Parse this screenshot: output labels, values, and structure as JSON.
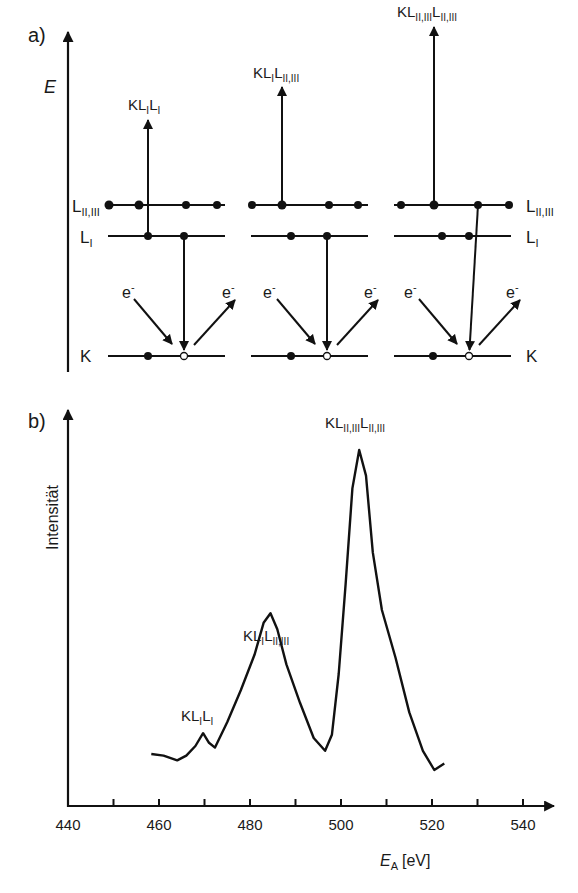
{
  "panel_a": {
    "label": "a)",
    "axis_label": "E",
    "levels": {
      "L23": {
        "main": "L",
        "sub": "II,III"
      },
      "L1": {
        "main": "L",
        "sub": "I"
      },
      "K": {
        "main": "K",
        "sub": ""
      }
    },
    "electron_label": "e",
    "electron_sup": "-",
    "transitions": [
      {
        "name": "KL1L1",
        "parts": [
          [
            "K",
            ""
          ],
          [
            "L",
            "I"
          ],
          [
            "L",
            "I"
          ]
        ]
      },
      {
        "name": "KL1L23",
        "parts": [
          [
            "K",
            ""
          ],
          [
            "L",
            "I"
          ],
          [
            "L",
            "II,III"
          ]
        ]
      },
      {
        "name": "KL23L23",
        "parts": [
          [
            "K",
            ""
          ],
          [
            "L",
            "II,III"
          ],
          [
            "L",
            "II,III"
          ]
        ]
      }
    ]
  },
  "panel_b": {
    "label": "b)",
    "ylabel": "Intensität",
    "xlabel_main": "E",
    "xlabel_sub": "A",
    "xlabel_unit": "[eV]",
    "peak_labels": [
      {
        "name": "KL1L1",
        "parts": [
          [
            "K",
            ""
          ],
          [
            "L",
            "I"
          ],
          [
            "L",
            "I"
          ]
        ]
      },
      {
        "name": "KL1L23",
        "parts": [
          [
            "K",
            ""
          ],
          [
            "L",
            "I"
          ],
          [
            "L",
            "II,III"
          ]
        ]
      },
      {
        "name": "KL23L23",
        "parts": [
          [
            "K",
            ""
          ],
          [
            "L",
            "II,III"
          ],
          [
            "L",
            "II,III"
          ]
        ]
      }
    ]
  },
  "chart_data": {
    "type": "line",
    "title": "",
    "xlabel": "E_A [eV]",
    "ylabel": "Intensität",
    "xlim": [
      440,
      545
    ],
    "xticks": [
      440,
      450,
      460,
      470,
      480,
      490,
      500,
      510,
      520,
      530,
      540
    ],
    "xtick_labels": [
      "440",
      "460",
      "480",
      "500",
      "520",
      "540"
    ],
    "y_units": "arbitrary (no ticks)",
    "grid": false,
    "legend": null,
    "series": [
      {
        "name": "Auger spectrum",
        "x": [
          458.3,
          461,
          464,
          466,
          468,
          469.7,
          471,
          472.3,
          475,
          478,
          481,
          483,
          484.5,
          486,
          488,
          491,
          494,
          496.5,
          498,
          499.5,
          501,
          502.5,
          504,
          505.5,
          507,
          509,
          512,
          515,
          518,
          520.5,
          522.7
        ],
        "y": [
          0.05,
          0.045,
          0.03,
          0.045,
          0.075,
          0.115,
          0.085,
          0.07,
          0.15,
          0.25,
          0.36,
          0.46,
          0.49,
          0.44,
          0.33,
          0.21,
          0.1,
          0.06,
          0.11,
          0.3,
          0.58,
          0.88,
          1.0,
          0.92,
          0.68,
          0.5,
          0.35,
          0.18,
          0.06,
          0.0,
          0.02
        ]
      }
    ],
    "annotations": [
      {
        "text": "KL_I L_I",
        "x": 469.7,
        "note": "small peak"
      },
      {
        "text": "KL_I L_II,III",
        "x": 484.5,
        "note": "medium peak"
      },
      {
        "text": "KL_II,III L_II,III",
        "x": 504,
        "note": "main peak"
      }
    ]
  }
}
